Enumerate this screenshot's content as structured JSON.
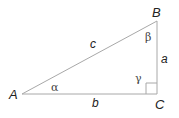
{
  "figure": {
    "type": "right-triangle",
    "line_color": "#a8a8a8",
    "text_color": "#222222",
    "vertices": [
      {
        "label": "A",
        "x": 22,
        "y": 94
      },
      {
        "label": "B",
        "x": 157,
        "y": 21
      },
      {
        "label": "C",
        "x": 157,
        "y": 94
      }
    ],
    "sides": [
      {
        "label": "a",
        "between": "B-C"
      },
      {
        "label": "b",
        "between": "A-C"
      },
      {
        "label": "c",
        "between": "A-B"
      }
    ],
    "angles": [
      {
        "label": "α",
        "at": "A"
      },
      {
        "label": "β",
        "at": "B"
      },
      {
        "label": "γ",
        "at": "C",
        "right_angle": true
      }
    ]
  }
}
